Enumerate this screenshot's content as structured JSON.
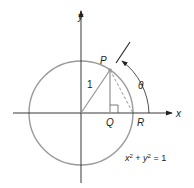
{
  "diagram": {
    "axes": {
      "x_label": "x",
      "y_label": "y"
    },
    "points": {
      "P": "P",
      "Q": "Q",
      "R": "R"
    },
    "radius_label": "1",
    "angle_label": "θ",
    "equation": {
      "lhs_x": "x",
      "sup1": "2",
      "plus": " + ",
      "lhs_y": "y",
      "sup2": "2",
      "rhs": " = 1"
    },
    "colors": {
      "circle": "#9a9a9a",
      "axes": "#222222",
      "lines": "#9a9a9a",
      "text": "#222222"
    }
  }
}
